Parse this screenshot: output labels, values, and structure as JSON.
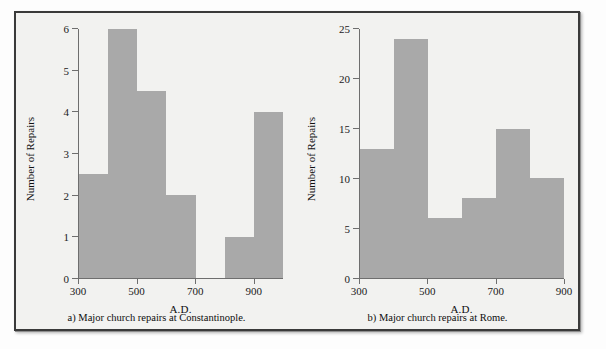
{
  "figure": {
    "panels": [
      {
        "id": "panel-a",
        "caption": "a) Major church repairs at Constantinople.",
        "ylabel": "Number of Repairs",
        "xlabel": "A.D."
      },
      {
        "id": "panel-b",
        "caption": "b) Major church repairs at Rome.",
        "ylabel": "Number of Repairs",
        "xlabel": "A.D."
      }
    ]
  },
  "colors": {
    "bar": "#a9a9a9",
    "axis": "#6e6e6e",
    "frame": "#3a3a3a",
    "background": "#f2f2f0",
    "text": "#101010"
  },
  "chart_data": [
    {
      "type": "bar",
      "title": "a) Major church repairs at Constantinople.",
      "xlabel": "A.D.",
      "ylabel": "Number of Repairs",
      "categories": [
        "300-400",
        "400-500",
        "500-600",
        "600-700",
        "700-800",
        "800-900",
        "900-1000"
      ],
      "values": [
        2.5,
        6,
        4.5,
        2,
        0,
        1,
        4
      ],
      "ylim": [
        0,
        6
      ],
      "yticks": [
        0,
        1,
        2,
        3,
        4,
        5,
        6
      ],
      "yticklabels": [
        "0",
        "1",
        "2",
        "3",
        "4",
        "5",
        "6"
      ],
      "xlim": [
        300,
        1000
      ],
      "xticks": [
        300,
        500,
        700,
        900
      ],
      "xticklabels": [
        "300",
        "500",
        "700",
        "900"
      ],
      "grid": false,
      "legend": false
    },
    {
      "type": "bar",
      "title": "b) Major church repairs at Rome.",
      "xlabel": "A.D.",
      "ylabel": "Number of Repairs",
      "categories": [
        "300-400",
        "400-500",
        "500-600",
        "600-700",
        "700-800",
        "800-900"
      ],
      "values": [
        13,
        24,
        6,
        8,
        15,
        10
      ],
      "ylim": [
        0,
        25
      ],
      "yticks": [
        0,
        5,
        10,
        15,
        20,
        25
      ],
      "yticklabels": [
        "0",
        "5",
        "10",
        "15",
        "20",
        "25"
      ],
      "xlim": [
        300,
        900
      ],
      "xticks": [
        300,
        500,
        700,
        900
      ],
      "xticklabels": [
        "300",
        "500",
        "700",
        "900"
      ],
      "grid": false,
      "legend": false
    }
  ]
}
